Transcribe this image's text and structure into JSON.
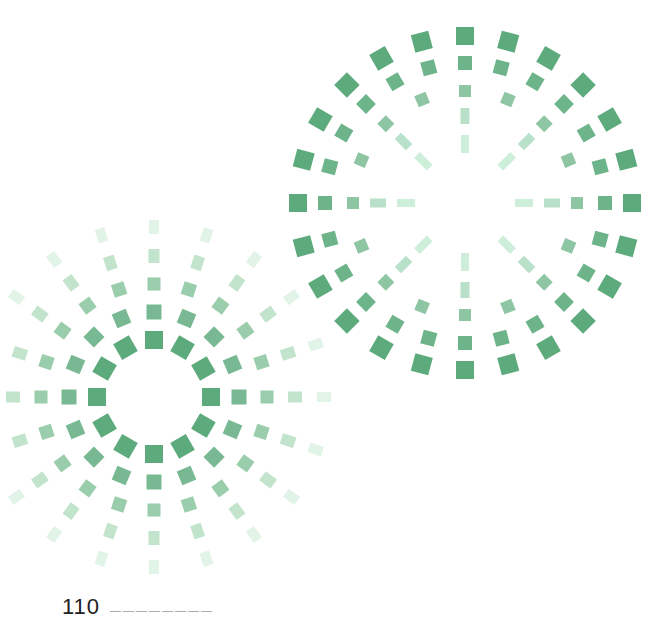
{
  "page": {
    "page_number": "110",
    "running_head": "————————"
  },
  "graphics": {
    "circles": [
      {
        "name": "dotted-circle-top-right",
        "cx": 465,
        "cy": 203,
        "rings": [
          {
            "r": 167,
            "count": 24,
            "w": 18,
            "h": 18,
            "color": "#5dab7c"
          },
          {
            "r": 140,
            "count": 24,
            "w": 14,
            "h": 14,
            "color": "#6db48a"
          },
          {
            "r": 112,
            "count": 16,
            "w": 12,
            "h": 12,
            "color": "#8ec5a3"
          },
          {
            "r": 87,
            "count": 8,
            "w": 9,
            "h": 16,
            "color": "#b9e0c8"
          },
          {
            "r": 59,
            "count": 8,
            "w": 8,
            "h": 18,
            "color": "#cdeed9"
          }
        ]
      },
      {
        "name": "dotted-circle-bottom-left",
        "cx": 154,
        "cy": 397,
        "rings": [
          {
            "r": 57,
            "count": 12,
            "w": 18,
            "h": 18,
            "color": "#5dab7c"
          },
          {
            "r": 85,
            "count": 16,
            "w": 15,
            "h": 15,
            "color": "#78b993"
          },
          {
            "r": 113,
            "count": 20,
            "w": 13,
            "h": 13,
            "color": "#9acdab"
          },
          {
            "r": 141,
            "count": 20,
            "w": 11,
            "h": 14,
            "color": "#c2e4cd"
          },
          {
            "r": 170,
            "count": 20,
            "w": 10,
            "h": 14,
            "color": "#e2f3e8"
          }
        ]
      }
    ]
  }
}
